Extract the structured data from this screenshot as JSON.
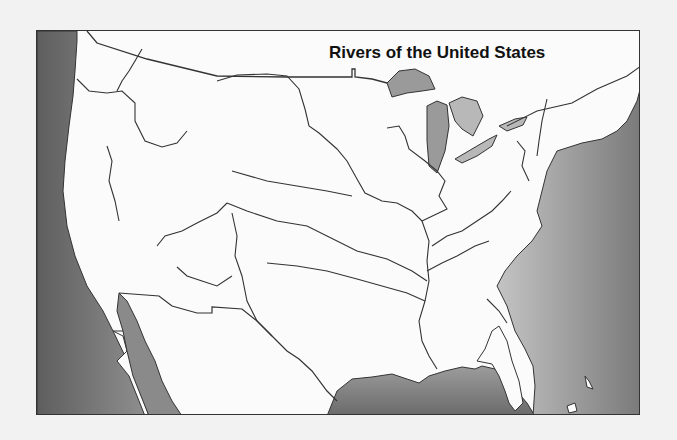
{
  "map": {
    "title": "Rivers of the United States",
    "colors": {
      "land": "#fbfbfb",
      "ocean_dark": "#6e6e6e",
      "ocean_light": "#b5b5b5",
      "lakes": "#9a9a9a",
      "lines": "#333333",
      "page_background": "#f2f2f2"
    },
    "features": [
      "Pacific Ocean",
      "Atlantic Ocean",
      "Gulf of Mexico",
      "Gulf of California",
      "Great Lakes",
      "Mississippi River",
      "Missouri River",
      "Ohio River",
      "Arkansas River",
      "Red River",
      "Rio Grande",
      "Colorado River",
      "Columbia River",
      "Snake River",
      "Hudson River",
      "Tennessee River"
    ]
  }
}
